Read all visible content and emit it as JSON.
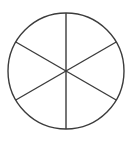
{
  "figure": {
    "name": "circle-divided-into-six-equal-sectors",
    "kind": "geometric-diagram",
    "title": "",
    "caption": "",
    "background_color": "#ffffff",
    "stroke_color": "#3c3c3c",
    "fill_color": "#ffffff",
    "stroke_width": 1.4,
    "canvas": {
      "width": 137,
      "height": 143
    }
  },
  "chart_data": {
    "type": "pie",
    "title": "",
    "xlabel": "",
    "ylabel": "",
    "labels": [
      "",
      "",
      "",
      "",
      "",
      ""
    ],
    "values": [
      1,
      1,
      1,
      1,
      1,
      1
    ],
    "fractions": [
      "1/6",
      "1/6",
      "1/6",
      "1/6",
      "1/6",
      "1/6"
    ],
    "slice_angle_degrees": 60,
    "slice_count": 6,
    "total_degrees": 360,
    "legend": false,
    "grid": false,
    "data_labels_shown": false,
    "slices": [
      {
        "index": 0,
        "start_angle": 90,
        "end_angle": 150,
        "share": 0.1667
      },
      {
        "index": 1,
        "start_angle": 150,
        "end_angle": 210,
        "share": 0.1667
      },
      {
        "index": 2,
        "start_angle": 210,
        "end_angle": 270,
        "share": 0.1667
      },
      {
        "index": 3,
        "start_angle": 270,
        "end_angle": 330,
        "share": 0.1667
      },
      {
        "index": 4,
        "start_angle": 330,
        "end_angle": 30,
        "share": 0.1667
      },
      {
        "index": 5,
        "start_angle": 30,
        "end_angle": 90,
        "share": 0.1667
      }
    ]
  },
  "geometry": {
    "center": {
      "x": 66,
      "y": 71
    },
    "radius": 58,
    "diameters": [
      {
        "name": "vertical-diameter",
        "angle_degrees": 90,
        "x1": 66,
        "y1": 13,
        "x2": 66,
        "y2": 129
      },
      {
        "name": "diagonal-diameter-up",
        "angle_degrees": 30,
        "x1": 15.8,
        "y1": 42,
        "x2": 116.2,
        "y2": 100
      },
      {
        "name": "diagonal-diameter-dn",
        "angle_degrees": 150,
        "x1": 15.8,
        "y1": 100,
        "x2": 116.2,
        "y2": 42
      }
    ],
    "circle_bounds": {
      "left": 8,
      "top": 13,
      "right": 124,
      "bottom": 129
    }
  }
}
